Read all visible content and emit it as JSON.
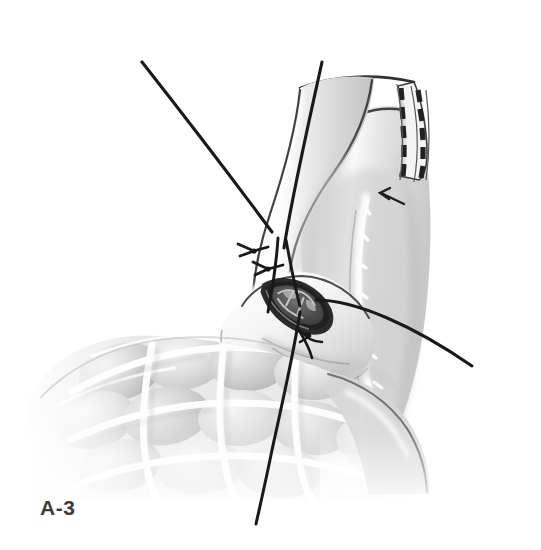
{
  "figure": {
    "label": "A-3",
    "domain_type": "medical-surgical-illustration",
    "medium": "halftone pen-and-ink / airbrush grayscale drawing",
    "background_color": "#ffffff",
    "ink_color": "#1a1a1a",
    "caption_color": "#3c3c3c",
    "canvas": {
      "width": 541,
      "height": 550
    }
  },
  "palette": {
    "paper": "#ffffff",
    "ink": "#1a1a1a",
    "outline": "#4a4a4a",
    "tissue_light": "#f2f2f2",
    "tissue_mid": "#d8d8d8",
    "tissue_shadow": "#b4b4b4",
    "tissue_deep": "#9a9a9a",
    "lumen_dark": "#3a3a3a",
    "highlight": "#fdfdfd"
  },
  "anatomy": [
    {
      "id": "proximal-limb",
      "name": "proximal bowel limb",
      "description": "tubular bowel segment descending from upper right, curving down toward the anastomosis",
      "shading": "airbrushed gray with bright highlight along the anterior surface"
    },
    {
      "id": "stapled-end",
      "name": "stapled closed end",
      "description": "blind end of the bowel limb closed with a double row of linear staples at the upper right",
      "staple_rows": 2,
      "staple_count_per_row": 9
    },
    {
      "id": "distal-limb",
      "name": "distal bowel limb / efferent loop",
      "description": "large shaded limb filling the right half, with mesenteric border highlight running down its length"
    },
    {
      "id": "bowel-loops",
      "name": "adjacent bowel loops",
      "description": "cluster of lobulated haustrated bowel loops occupying the lower left quadrant"
    },
    {
      "id": "mesentery",
      "name": "mesenteric fold",
      "description": "thin translucent mesenteric sheet between the limbs"
    }
  ],
  "surgical_features": [
    {
      "id": "anastomotic-stoma",
      "name": "anastomotic opening (enterotomy)",
      "shape": "almond / lenticular",
      "description": "dark open lumen at the center of the field showing mucosal folds inside",
      "center": {
        "x": 298,
        "y": 302
      }
    },
    {
      "id": "stay-suture-upper",
      "name": "upper stay suture knot",
      "description": "tied knot with two cut tails at the superior corner of the anastomosis",
      "position": {
        "x": 251,
        "y": 250
      }
    },
    {
      "id": "stay-suture-lower",
      "name": "lower stay suture knot",
      "description": "second tied knot just inferior to the first",
      "position": {
        "x": 266,
        "y": 268
      }
    },
    {
      "id": "stay-suture-inferior",
      "name": "inferior stay suture knot",
      "description": "knot at the inferior angle of the stoma",
      "position": {
        "x": 306,
        "y": 334
      }
    },
    {
      "id": "traction-sutures",
      "name": "traction suture strands",
      "description": "long black suture strands held under tension, running off the top, right and bottom of the field",
      "strand_count": 5
    },
    {
      "id": "pointer-arrow",
      "name": "annotation arrow",
      "description": "small arrow in the upper right pointing left toward the mesenteric/serosal junction beneath the staple line",
      "position": {
        "x": 390,
        "y": 196
      },
      "direction": "left"
    }
  ],
  "annotations": {
    "arrows": 1,
    "knots": 3,
    "staple_lines": 1
  }
}
